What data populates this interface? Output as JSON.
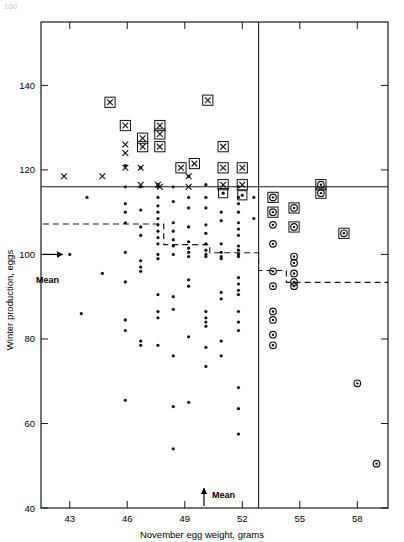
{
  "figure": {
    "corner_note": "160",
    "width": 404,
    "height": 542
  },
  "chart_data": {
    "type": "scatter",
    "title": "",
    "xlabel": "November egg weight, grams",
    "ylabel": "Winter production, eggs",
    "xlim": [
      41.5,
      59.6
    ],
    "ylim": [
      40,
      155
    ],
    "xticks": [
      43,
      46,
      49,
      52,
      55,
      58
    ],
    "xtick_labels": [
      "43",
      "46",
      "49",
      "52",
      "55",
      "58"
    ],
    "yticks": [
      40,
      60,
      80,
      100,
      120,
      140
    ],
    "ytick_labels": [
      "40",
      "60",
      "80",
      "100",
      "120",
      "140"
    ],
    "grid": false,
    "legend": null,
    "annotations": {
      "x_mean_label": "Mean",
      "x_mean_value": 50.0,
      "y_mean_label": "Mean",
      "y_mean_value": 100.0,
      "selection_horizontal_line_y": 116,
      "selection_vertical_line_x": 52.85,
      "step_line_label": "stepped selection boundary"
    },
    "step_line": [
      [
        41.6,
        107.2
      ],
      [
        47.9,
        107.2
      ],
      [
        47.9,
        102.3
      ],
      [
        50.3,
        102.3
      ],
      [
        50.3,
        100.4
      ],
      [
        52.85,
        100.4
      ],
      [
        52.85,
        96.2
      ],
      [
        54.3,
        96.2
      ],
      [
        54.3,
        93.4
      ],
      [
        59.6,
        93.4
      ]
    ],
    "series": [
      {
        "name": "unselected-dot",
        "marker": "dot",
        "points": [
          [
            43.0,
            100.0
          ],
          [
            43.9,
            113.5
          ],
          [
            44.7,
            95.5
          ],
          [
            43.6,
            86.0
          ],
          [
            45.9,
            121.0
          ],
          [
            45.9,
            116.0
          ],
          [
            45.9,
            112.0
          ],
          [
            45.9,
            110.0
          ],
          [
            45.9,
            107.5
          ],
          [
            45.9,
            100.5
          ],
          [
            45.9,
            93.5
          ],
          [
            45.9,
            84.5
          ],
          [
            45.9,
            82.0
          ],
          [
            45.9,
            65.5
          ],
          [
            46.7,
            120.5
          ],
          [
            46.7,
            116.0
          ],
          [
            46.7,
            110.5
          ],
          [
            46.7,
            106.5
          ],
          [
            46.7,
            104.5
          ],
          [
            46.7,
            98.5
          ],
          [
            46.7,
            97.0
          ],
          [
            46.7,
            96.0
          ],
          [
            46.7,
            79.5
          ],
          [
            46.7,
            78.5
          ],
          [
            47.6,
            116.5
          ],
          [
            47.6,
            116.0
          ],
          [
            47.6,
            113.5
          ],
          [
            47.6,
            111.5
          ],
          [
            47.6,
            110.0
          ],
          [
            47.6,
            108.5
          ],
          [
            47.6,
            107.0
          ],
          [
            47.6,
            105.5
          ],
          [
            47.6,
            104.0
          ],
          [
            47.6,
            102.5
          ],
          [
            47.6,
            100.0
          ],
          [
            47.6,
            99.0
          ],
          [
            47.6,
            90.5
          ],
          [
            47.6,
            86.5
          ],
          [
            47.6,
            85.0
          ],
          [
            47.6,
            78.5
          ],
          [
            48.4,
            116.0
          ],
          [
            48.4,
            112.5
          ],
          [
            48.4,
            107.5
          ],
          [
            48.4,
            105.5
          ],
          [
            48.4,
            103.5
          ],
          [
            48.4,
            102.0
          ],
          [
            48.4,
            100.0
          ],
          [
            48.4,
            90.0
          ],
          [
            48.4,
            87.0
          ],
          [
            48.4,
            76.0
          ],
          [
            48.4,
            64.0
          ],
          [
            48.4,
            54.0
          ],
          [
            49.2,
            118.5
          ],
          [
            49.2,
            113.5
          ],
          [
            49.2,
            111.0
          ],
          [
            49.2,
            106.5
          ],
          [
            49.2,
            103.0
          ],
          [
            49.2,
            101.5
          ],
          [
            49.2,
            100.5
          ],
          [
            49.2,
            99.5
          ],
          [
            49.2,
            94.0
          ],
          [
            49.2,
            92.5
          ],
          [
            49.2,
            80.5
          ],
          [
            49.2,
            65.0
          ],
          [
            50.1,
            116.5
          ],
          [
            50.1,
            113.5
          ],
          [
            50.1,
            111.0
          ],
          [
            50.1,
            107.0
          ],
          [
            50.1,
            105.0
          ],
          [
            50.1,
            102.5
          ],
          [
            50.1,
            101.0
          ],
          [
            50.1,
            100.0
          ],
          [
            50.1,
            99.5
          ],
          [
            50.1,
            86.5
          ],
          [
            50.1,
            85.0
          ],
          [
            50.1,
            84.0
          ],
          [
            50.1,
            83.0
          ],
          [
            50.1,
            78.0
          ],
          [
            50.1,
            73.5
          ],
          [
            50.9,
            110.0
          ],
          [
            50.9,
            108.0
          ],
          [
            50.9,
            102.5
          ],
          [
            50.9,
            100.5
          ],
          [
            50.9,
            99.5
          ],
          [
            50.9,
            99.0
          ],
          [
            50.9,
            91.0
          ],
          [
            50.9,
            89.5
          ],
          [
            50.9,
            79.5
          ],
          [
            50.9,
            76.0
          ],
          [
            51.8,
            116.0
          ],
          [
            51.8,
            113.5
          ],
          [
            51.8,
            112.0
          ],
          [
            51.8,
            110.0
          ],
          [
            51.8,
            107.5
          ],
          [
            51.8,
            106.0
          ],
          [
            51.8,
            104.5
          ],
          [
            51.8,
            102.0
          ],
          [
            51.8,
            101.0
          ],
          [
            51.8,
            100.0
          ],
          [
            51.8,
            99.5
          ],
          [
            51.8,
            94.5
          ],
          [
            51.8,
            93.0
          ],
          [
            51.8,
            91.5
          ],
          [
            51.8,
            90.5
          ],
          [
            51.8,
            86.5
          ],
          [
            51.8,
            84.0
          ],
          [
            51.8,
            82.0
          ],
          [
            51.8,
            68.5
          ],
          [
            51.8,
            63.5
          ],
          [
            51.8,
            57.5
          ],
          [
            52.6,
            113.5
          ],
          [
            52.6,
            108.5
          ]
        ]
      },
      {
        "name": "x-light-plain",
        "marker": "x",
        "points": [
          [
            42.7,
            118.5
          ],
          [
            44.7,
            118.5
          ],
          [
            45.9,
            120.5
          ],
          [
            45.9,
            126.0
          ],
          [
            45.9,
            124.0
          ],
          [
            46.7,
            120.5
          ],
          [
            46.7,
            116.5
          ],
          [
            47.6,
            116.5
          ],
          [
            47.7,
            116.0
          ],
          [
            49.2,
            118.5
          ],
          [
            49.2,
            116.0
          ]
        ]
      },
      {
        "name": "x-boxed",
        "marker": "x-box",
        "points": [
          [
            45.1,
            136.0
          ],
          [
            45.9,
            130.5
          ],
          [
            46.8,
            127.5
          ],
          [
            46.8,
            125.5
          ],
          [
            47.7,
            130.5
          ],
          [
            47.7,
            128.5
          ],
          [
            47.7,
            125.5
          ],
          [
            48.8,
            120.5
          ],
          [
            49.5,
            121.5
          ],
          [
            50.2,
            136.5
          ],
          [
            51.0,
            125.5
          ],
          [
            51.0,
            120.5
          ],
          [
            51.0,
            116.5
          ],
          [
            52.0,
            120.5
          ],
          [
            52.0,
            116.5
          ]
        ]
      },
      {
        "name": "dot-boxed",
        "marker": "dot-box",
        "points": [
          [
            51.0,
            114.5
          ],
          [
            52.0,
            114.0
          ]
        ]
      },
      {
        "name": "circle-plain",
        "marker": "circle",
        "points": [
          [
            53.6,
            107.0
          ],
          [
            53.6,
            102.5
          ],
          [
            53.6,
            96.0
          ],
          [
            53.6,
            92.5
          ],
          [
            54.7,
            99.5
          ],
          [
            54.7,
            98.0
          ],
          [
            54.7,
            95.5
          ],
          [
            54.7,
            93.5
          ],
          [
            54.7,
            92.5
          ],
          [
            53.6,
            86.5
          ],
          [
            53.6,
            84.5
          ],
          [
            53.6,
            81.0
          ],
          [
            53.6,
            78.5
          ],
          [
            58.0,
            69.5
          ],
          [
            59.0,
            50.5
          ]
        ]
      },
      {
        "name": "circle-boxed",
        "marker": "circle-box",
        "points": [
          [
            53.6,
            113.5
          ],
          [
            53.6,
            110.0
          ],
          [
            54.7,
            111.0
          ],
          [
            54.7,
            106.5
          ],
          [
            56.1,
            116.5
          ],
          [
            56.1,
            114.5
          ],
          [
            57.3,
            105.0
          ]
        ]
      }
    ]
  },
  "axes": {
    "x_title": "November egg weight, grams",
    "y_title": "Winter production, eggs"
  },
  "markers_legend_semantics": {
    "dot": "individual hen record",
    "x": "selected on production only",
    "x-box": "selected on both criteria",
    "circle": "selected on egg weight only",
    "circle-box": "selected on both criteria"
  }
}
